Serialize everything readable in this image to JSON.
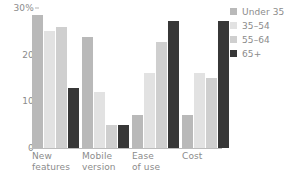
{
  "chart_data": {
    "type": "bar",
    "title": "",
    "subtitle": "",
    "xlabel": "",
    "ylabel": "",
    "categories": [
      "New features",
      "Mobile version",
      "Ease of use",
      "Cost"
    ],
    "category_lines": [
      [
        "New",
        "features"
      ],
      [
        "Mobile",
        "version"
      ],
      [
        "Ease",
        "of use"
      ],
      [
        "Cost"
      ]
    ],
    "series": [
      {
        "name": "Under 35",
        "color": "#b9b9b9",
        "values": [
          28.5,
          23.7,
          7.0,
          7.0
        ]
      },
      {
        "name": "35–54",
        "color": "#e2e2e2",
        "values": [
          25.0,
          12.0,
          16.0,
          16.0
        ]
      },
      {
        "name": "55–64",
        "color": "#cfcfcf",
        "values": [
          26.0,
          5.0,
          22.7,
          15.0
        ]
      },
      {
        "name": "65+",
        "color": "#373737",
        "values": [
          12.8,
          5.0,
          27.2,
          27.2
        ]
      }
    ],
    "ylim": [
      0,
      30
    ],
    "yticks": [
      0,
      10,
      20,
      30
    ],
    "ytick_labels": [
      "0",
      "10",
      "20",
      "30%"
    ],
    "grid": false,
    "legend_position": "right",
    "axis_color": "#bcbcbc",
    "text_color": "#8b8b8b"
  },
  "legend": {
    "entries": [
      {
        "label": "Under 35"
      },
      {
        "label": "35–54"
      },
      {
        "label": "55–64"
      },
      {
        "label": "65+"
      }
    ]
  }
}
